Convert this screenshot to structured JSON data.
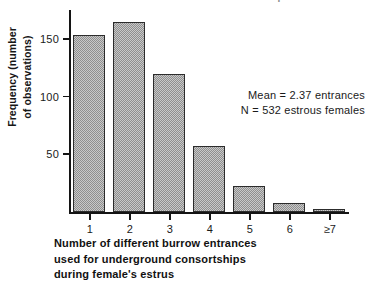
{
  "figure": {
    "clipped_title": "burrow entrances used for consortships"
  },
  "annotation": {
    "mean_line": "Mean  =  2.37  entrances",
    "n_line": "N  =  532  estrous  females"
  },
  "caption": {
    "line1": "Number   of   different   burrow   entrances",
    "line2": "used  for  underground  consortships",
    "line3": "during  female's  estrus"
  },
  "ylabel": {
    "line1": "Frequency  (number",
    "line2": "of  observations)"
  },
  "chart_data": {
    "type": "bar",
    "title": "",
    "xlabel": "Number of different burrow entrances used for underground consortships during female's estrus",
    "ylabel": "Frequency (number of observations)",
    "categories": [
      "1",
      "2",
      "3",
      "4",
      "5",
      "6",
      "≥7"
    ],
    "values": [
      154,
      166,
      120,
      58,
      23,
      8,
      3
    ],
    "ylim": [
      0,
      176
    ],
    "yticks": [
      50,
      100,
      150
    ],
    "ytick_labels": [
      "50",
      "100",
      "150"
    ],
    "xlim": [
      0,
      7
    ],
    "grid": false,
    "legend": false,
    "bar_fill": "#8f8f8f",
    "bar_edge": "#2c2c2c",
    "axis_color": "#141414",
    "background": "#ffffff",
    "annotations": [
      "Mean = 2.37 entrances",
      "N = 532 estrous females"
    ]
  }
}
